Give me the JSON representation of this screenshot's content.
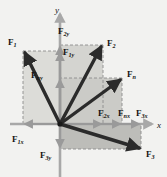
{
  "figure": {
    "type": "vector-decomposition-diagram",
    "background_color": "#f2f2f0",
    "vector_color": "#2b2b2b",
    "axis_color": "#a8a8a8",
    "component_arrow_color": "#9a9a9a",
    "dashed_color": "#8c8c8c",
    "shade_light": "#dcdcd8",
    "shade_mid": "#cfcfcb",
    "shade_dark": "#bdbdb9"
  },
  "axes": {
    "x_label": "x",
    "y_label": "y",
    "origin": {
      "x": 60,
      "y": 124
    }
  },
  "vectors": [
    {
      "name": "F1",
      "label_main": "F",
      "label_sub": "1",
      "label_x": 8,
      "label_y": 45,
      "tip": {
        "x": 23,
        "y": 51
      },
      "quadrant": "upper-left"
    },
    {
      "name": "F2",
      "label_main": "F",
      "label_sub": "2",
      "label_x": 107,
      "label_y": 46,
      "tip": {
        "x": 103,
        "y": 45
      },
      "quadrant": "upper-right"
    },
    {
      "name": "Fn",
      "label_main": "F",
      "label_sub": "n",
      "label_x": 127,
      "label_y": 77,
      "tip": {
        "x": 122,
        "y": 78
      },
      "quadrant": "upper-right"
    },
    {
      "name": "F3",
      "label_main": "F",
      "label_sub": "3",
      "label_x": 146,
      "label_y": 157,
      "tip": {
        "x": 141,
        "y": 149
      },
      "quadrant": "lower-right"
    }
  ],
  "components": [
    {
      "name": "F2y",
      "label_main": "F",
      "label_sub": "2y",
      "label_x": 58,
      "label_y": 34,
      "axis": "y",
      "value_y": 45
    },
    {
      "name": "F1y",
      "label_main": "F",
      "label_sub": "1y",
      "label_x": 63,
      "label_y": 55,
      "axis": "y",
      "value_y": 51
    },
    {
      "name": "Fny",
      "label_main": "F",
      "label_sub": "ny",
      "label_x": 31,
      "label_y": 78,
      "axis": "y",
      "value_y": 78
    },
    {
      "name": "F1x",
      "label_main": "F",
      "label_sub": "1x",
      "label_x": 12,
      "label_y": 142,
      "axis": "x",
      "value_x": 23
    },
    {
      "name": "F3y",
      "label_main": "F",
      "label_sub": "3y",
      "label_x": 40,
      "label_y": 158,
      "axis": "y",
      "value_y": 149
    },
    {
      "name": "F2x",
      "label_main": "F",
      "label_sub": "2x",
      "label_x": 98,
      "label_y": 116,
      "axis": "x",
      "value_x": 103
    },
    {
      "name": "Fnx",
      "label_main": "F",
      "label_sub": "nx",
      "label_x": 118,
      "label_y": 116,
      "axis": "x",
      "value_x": 122
    },
    {
      "name": "F3x",
      "label_main": "F",
      "label_sub": "3x",
      "label_x": 136,
      "label_y": 116,
      "axis": "x",
      "value_x": 141
    }
  ]
}
